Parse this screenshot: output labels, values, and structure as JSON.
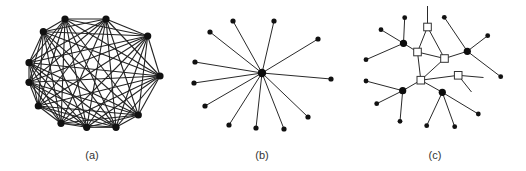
{
  "figure": {
    "panels": [
      {
        "id": "a",
        "label": "(a)",
        "label_pos": [
          92,
          155
        ],
        "type": "complete-graph",
        "nodes": [
          [
            65,
            19
          ],
          [
            106,
            19
          ],
          [
            147.7,
            36
          ],
          [
            160,
            76
          ],
          [
            138.3,
            115
          ],
          [
            116,
            127.3
          ],
          [
            86.7,
            127.3
          ],
          [
            61,
            123.3
          ],
          [
            38.3,
            106
          ],
          [
            29,
            82.3
          ],
          [
            29,
            62.7
          ],
          [
            43.3,
            31.7
          ]
        ],
        "node_radius": 3.6
      },
      {
        "id": "b",
        "label": "(b)",
        "label_pos": [
          262,
          155
        ],
        "type": "star-graph",
        "center": [
          262,
          73
        ],
        "center_radius": 4.2,
        "leaves": [
          [
            233,
            21
          ],
          [
            274,
            21
          ],
          [
            318,
            39
          ],
          [
            331,
            79
          ],
          [
            308,
            117
          ],
          [
            284,
            129
          ],
          [
            256,
            128
          ],
          [
            229,
            125
          ],
          [
            205,
            106
          ],
          [
            194,
            83
          ],
          [
            195,
            62
          ],
          [
            210,
            32
          ]
        ],
        "leaf_radius": 2.6
      },
      {
        "id": "c",
        "label": "(c)",
        "label_pos": [
          435,
          155
        ],
        "type": "hub-switch-graph",
        "squares": [
          {
            "id": "s1",
            "pos": [
              427.5,
              27
            ]
          },
          {
            "id": "s2",
            "pos": [
              417.5,
              52
            ]
          },
          {
            "id": "s3",
            "pos": [
              444.5,
              58.5
            ]
          },
          {
            "id": "s4",
            "pos": [
              458.2,
              75.3
            ]
          },
          {
            "id": "s5",
            "pos": [
              420.8,
              80.2
            ]
          }
        ],
        "square_size": 7.6,
        "hubs": [
          {
            "id": "h1",
            "pos": [
              403.5,
              43.3
            ]
          },
          {
            "id": "h2",
            "pos": [
              467.3,
              51.3
            ]
          },
          {
            "id": "h3",
            "pos": [
              402.7,
              90.7
            ]
          },
          {
            "id": "h4",
            "pos": [
              442.3,
              92.3
            ]
          }
        ],
        "hub_radius": 3.6,
        "leaves": [
          {
            "id": "l1",
            "pos": [
              404.7,
              17.7
            ]
          },
          {
            "id": "l2",
            "pos": [
              381,
              29.7
            ]
          },
          {
            "id": "l3",
            "pos": [
              366,
              59.7
            ]
          },
          {
            "id": "l4",
            "pos": [
              444.3,
              17.3
            ]
          },
          {
            "id": "l5",
            "pos": [
              487.7,
              35.7
            ]
          },
          {
            "id": "l6",
            "pos": [
              500.7,
              76.7
            ]
          },
          {
            "id": "l7",
            "pos": [
              366,
              81
            ]
          },
          {
            "id": "l8",
            "pos": [
              376.7,
              103.7
            ]
          },
          {
            "id": "l9",
            "pos": [
              400,
              121.3
            ]
          },
          {
            "id": "l10",
            "pos": [
              426.7,
              125.7
            ]
          },
          {
            "id": "l11",
            "pos": [
              454.7,
              126.7
            ]
          },
          {
            "id": "l12",
            "pos": [
              478.3,
              114
            ]
          }
        ],
        "leaf_radius": 2.4,
        "dangling_ends": [
          {
            "from": "s1",
            "to": [
              427.5,
              6
            ]
          },
          {
            "from": "s4",
            "to": [
              483.5,
              77.5
            ]
          },
          {
            "from": "s4",
            "to": [
              471.5,
              92
            ]
          }
        ],
        "edges": [
          [
            "s1",
            "s2"
          ],
          [
            "s1",
            "s3"
          ],
          [
            "s2",
            "s3"
          ],
          [
            "s2",
            "s5"
          ],
          [
            "s3",
            "s5"
          ],
          [
            "s5",
            "s4"
          ],
          [
            "s3",
            "h2"
          ],
          [
            "h1",
            "s2"
          ],
          [
            "h1",
            "l1"
          ],
          [
            "h1",
            "l2"
          ],
          [
            "h1",
            "l3"
          ],
          [
            "h2",
            "l4"
          ],
          [
            "h2",
            "l5"
          ],
          [
            "h2",
            "l6"
          ],
          [
            "s5",
            "h3"
          ],
          [
            "h3",
            "l7"
          ],
          [
            "h3",
            "l8"
          ],
          [
            "h3",
            "l9"
          ],
          [
            "s5",
            "h4"
          ],
          [
            "h4",
            "l10"
          ],
          [
            "h4",
            "l11"
          ],
          [
            "h4",
            "l12"
          ]
        ]
      }
    ]
  }
}
